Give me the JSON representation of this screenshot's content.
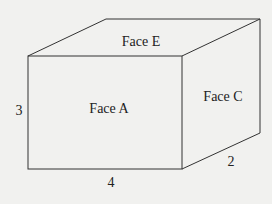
{
  "diagram": {
    "type": "rectangular prism",
    "faces": {
      "top": "Face E",
      "front": "Face A",
      "side": "Face C"
    },
    "dimensions": {
      "height": "3",
      "length": "4",
      "depth": "2"
    },
    "colors": {
      "background": "#f1f1ef",
      "stroke": "#333333",
      "text": "#222222"
    }
  }
}
